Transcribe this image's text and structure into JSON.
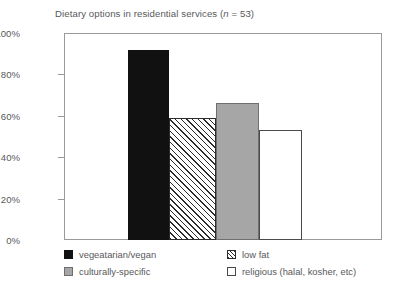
{
  "chart_data": {
    "type": "bar",
    "title": "Dietary options in residential services (n = 53)",
    "title_prefix": "Dietary options in residential services (",
    "title_italic": "n",
    "title_suffix": " = 53)",
    "xlabel": "",
    "ylabel": "",
    "ylim": [
      0,
      100
    ],
    "y_unit": "%",
    "grid": false,
    "legend_position": "bottom",
    "categories": [
      "vegeatarian/vegan",
      "low fat",
      "culturally-specific",
      "religious (halal, kosher, etc)"
    ],
    "values": [
      92,
      59,
      66,
      53
    ],
    "bar_styles": [
      "solid-black",
      "hatched",
      "gray",
      "white"
    ],
    "y_ticks": [
      {
        "value": 100,
        "label": "100%"
      },
      {
        "value": 80,
        "label": "80%"
      },
      {
        "value": 60,
        "label": "60%"
      },
      {
        "value": 40,
        "label": "40%"
      },
      {
        "value": 20,
        "label": "20%"
      },
      {
        "value": 0,
        "label": "0%"
      }
    ],
    "legend": [
      {
        "label": "vegeatarian/vegan",
        "style": "solid-black"
      },
      {
        "label": "low fat",
        "style": "hatched"
      },
      {
        "label": "culturally-specific",
        "style": "gray"
      },
      {
        "label": "religious (halal, kosher, etc)",
        "style": "white"
      }
    ],
    "colors": {
      "bar_black": "#111111",
      "bar_gray": "#a6a6a6",
      "bar_white": "#ffffff",
      "hatch_line": "#2b2b2b",
      "axis": "#9a9a9a",
      "text": "#58595b",
      "background": "#ffffff"
    }
  }
}
